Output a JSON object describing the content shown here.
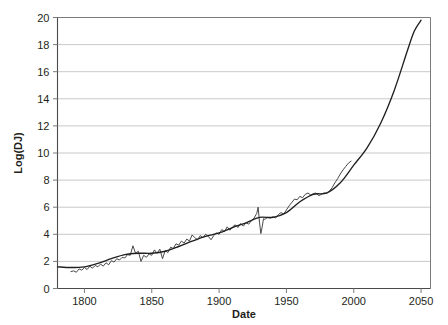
{
  "chart_data": {
    "type": "line",
    "title": "",
    "xlabel": "Date",
    "ylabel": "Log(DJ)",
    "xlim": [
      1780,
      2057
    ],
    "ylim": [
      0,
      20
    ],
    "grid": true,
    "legend": "none",
    "xticks": [
      1800,
      1850,
      1900,
      1950,
      2000,
      2050
    ],
    "yticks": [
      0,
      2,
      4,
      6,
      8,
      10,
      12,
      14,
      16,
      18,
      20
    ],
    "xtick_labels": [
      "1800",
      "1850",
      "1900",
      "1950",
      "2000",
      "2050"
    ],
    "ytick_labels": [
      "0",
      "2",
      "4",
      "6",
      "8",
      "10",
      "12",
      "14",
      "16",
      "18",
      "20"
    ],
    "series": [
      {
        "name": "Log(DJ) observed",
        "style": "jagged-line",
        "color": "#3f3f3f",
        "x": [
          1790,
          1792,
          1794,
          1796,
          1798,
          1800,
          1802,
          1804,
          1806,
          1808,
          1810,
          1812,
          1814,
          1816,
          1818,
          1820,
          1822,
          1824,
          1826,
          1828,
          1830,
          1832,
          1834,
          1836,
          1838,
          1840,
          1842,
          1844,
          1846,
          1848,
          1850,
          1852,
          1854,
          1856,
          1858,
          1860,
          1862,
          1864,
          1866,
          1868,
          1870,
          1872,
          1874,
          1876,
          1878,
          1880,
          1882,
          1884,
          1886,
          1888,
          1890,
          1892,
          1894,
          1896,
          1898,
          1900,
          1902,
          1904,
          1906,
          1908,
          1910,
          1912,
          1914,
          1916,
          1918,
          1920,
          1922,
          1924,
          1926,
          1928,
          1929,
          1930,
          1931,
          1932,
          1933,
          1934,
          1936,
          1938,
          1940,
          1942,
          1944,
          1946,
          1948,
          1950,
          1952,
          1954,
          1956,
          1958,
          1960,
          1962,
          1964,
          1966,
          1968,
          1970,
          1972,
          1974,
          1976,
          1978,
          1980,
          1982,
          1984,
          1986,
          1988,
          1990,
          1992,
          1994,
          1996,
          1998
        ],
        "y": [
          1.25,
          1.3,
          1.2,
          1.45,
          1.35,
          1.55,
          1.4,
          1.65,
          1.5,
          1.7,
          1.6,
          1.8,
          1.65,
          1.9,
          1.75,
          2.05,
          1.95,
          2.2,
          2.1,
          2.3,
          2.25,
          2.5,
          2.45,
          3.15,
          2.6,
          2.75,
          2.0,
          2.45,
          2.3,
          2.55,
          2.45,
          2.85,
          2.6,
          2.9,
          2.2,
          2.8,
          2.65,
          3.05,
          2.95,
          3.3,
          3.2,
          3.5,
          3.35,
          3.65,
          3.5,
          3.95,
          3.75,
          3.6,
          3.9,
          3.75,
          4.0,
          3.85,
          3.6,
          3.9,
          4.1,
          4.0,
          4.35,
          4.2,
          4.55,
          4.3,
          4.55,
          4.7,
          4.5,
          4.8,
          4.6,
          4.85,
          4.75,
          5.0,
          5.2,
          5.55,
          6.0,
          4.9,
          4.05,
          4.55,
          5.15,
          5.1,
          5.25,
          5.2,
          5.3,
          5.2,
          5.45,
          5.6,
          5.5,
          5.8,
          6.1,
          6.35,
          6.6,
          6.55,
          6.8,
          6.7,
          6.95,
          7.05,
          6.9,
          7.0,
          7.05,
          6.85,
          6.95,
          7.05,
          7.0,
          7.2,
          7.45,
          7.8,
          8.1,
          8.45,
          8.75,
          9.0,
          9.25,
          9.4
        ]
      },
      {
        "name": "Log(DJ) trend / projection",
        "style": "smooth-curve",
        "color": "#231f20",
        "x": [
          1780,
          1790,
          1800,
          1810,
          1820,
          1830,
          1840,
          1850,
          1860,
          1870,
          1880,
          1890,
          1900,
          1910,
          1920,
          1930,
          1940,
          1950,
          1960,
          1970,
          1980,
          1990,
          2000,
          2010,
          2020,
          2030,
          2040,
          2045,
          2050
        ],
        "y": [
          1.6,
          1.55,
          1.6,
          1.85,
          2.2,
          2.5,
          2.6,
          2.6,
          2.75,
          3.1,
          3.5,
          3.85,
          4.1,
          4.5,
          4.85,
          5.25,
          5.25,
          5.6,
          6.4,
          6.95,
          7.05,
          7.8,
          9.1,
          10.4,
          12.2,
          14.6,
          17.6,
          19.0,
          19.8
        ]
      }
    ]
  },
  "axis_labels": {
    "x_title": "Date",
    "y_title": "Log(DJ)"
  },
  "colors": {
    "gridline": "#c9c9c9",
    "axis": "#7b7b7b",
    "data_line": "#4a4a4a",
    "trend_line": "#231f20",
    "background": "#ffffff",
    "text": "#231f20"
  }
}
